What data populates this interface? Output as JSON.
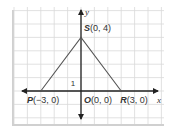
{
  "diagram": {
    "type": "coordinate-plane",
    "grid_units": {
      "x_min": -5,
      "x_max": 6,
      "y_min": -2,
      "y_max": 6
    },
    "axes": {
      "x_label": "x",
      "y_label": "y"
    },
    "unit_marker": "1",
    "triangle": [
      "P",
      "S",
      "R"
    ],
    "points": [
      {
        "name": "P",
        "coords": "(−3, 0)",
        "x": -3,
        "y": 0
      },
      {
        "name": "O",
        "coords": "(0, 0)",
        "x": 0,
        "y": 0
      },
      {
        "name": "R",
        "coords": "(3, 0)",
        "x": 3,
        "y": 0
      },
      {
        "name": "S",
        "coords": "(0, 4)",
        "x": 0,
        "y": 4
      }
    ],
    "colors": {
      "grid": "#d9d9d9",
      "axis": "#222222",
      "triangle": "#555555",
      "shadow": "#c8c8c8"
    }
  }
}
